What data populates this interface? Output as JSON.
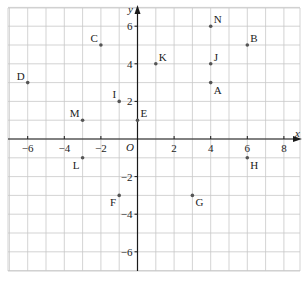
{
  "chart_data": {
    "type": "scatter",
    "title": "",
    "xlabel": "x",
    "ylabel": "y",
    "origin_label": "O",
    "xlim": [
      -7,
      8.9
    ],
    "ylim": [
      -7,
      7
    ],
    "grid": true,
    "x_ticks": [
      {
        "value": -6,
        "label": "−6"
      },
      {
        "value": -4,
        "label": "−4"
      },
      {
        "value": -2,
        "label": "−2"
      },
      {
        "value": 2,
        "label": "2"
      },
      {
        "value": 4,
        "label": "4"
      },
      {
        "value": 6,
        "label": "6"
      },
      {
        "value": 8,
        "label": "8"
      }
    ],
    "y_ticks": [
      {
        "value": 6,
        "label": "6"
      },
      {
        "value": 4,
        "label": "4"
      },
      {
        "value": 2,
        "label": "2"
      },
      {
        "value": -2,
        "label": "−2"
      },
      {
        "value": -4,
        "label": "−4"
      },
      {
        "value": -6,
        "label": "−6"
      }
    ],
    "points": [
      {
        "label": "A",
        "x": 4,
        "y": 3,
        "label_pos": "below-right"
      },
      {
        "label": "B",
        "x": 6,
        "y": 5,
        "label_pos": "above-right"
      },
      {
        "label": "C",
        "x": -2,
        "y": 5,
        "label_pos": "above-left"
      },
      {
        "label": "D",
        "x": -6,
        "y": 3,
        "label_pos": "above-left"
      },
      {
        "label": "E",
        "x": 0,
        "y": 1,
        "label_pos": "above-right"
      },
      {
        "label": "F",
        "x": -1,
        "y": -3,
        "label_pos": "below-left"
      },
      {
        "label": "G",
        "x": 3,
        "y": -3,
        "label_pos": "below-right"
      },
      {
        "label": "H",
        "x": 6,
        "y": -1,
        "label_pos": "below-right"
      },
      {
        "label": "I",
        "x": -1,
        "y": 2,
        "label_pos": "above-left"
      },
      {
        "label": "J",
        "x": 4,
        "y": 4,
        "label_pos": "above-right"
      },
      {
        "label": "K",
        "x": 1,
        "y": 4,
        "label_pos": "above-right"
      },
      {
        "label": "L",
        "x": -3,
        "y": -1,
        "label_pos": "below-left"
      },
      {
        "label": "M",
        "x": -3,
        "y": 1,
        "label_pos": "above-left"
      },
      {
        "label": "N",
        "x": 4,
        "y": 6,
        "label_pos": "above-right"
      }
    ],
    "colors": {
      "grid": "#c8c8c8",
      "axis": "#1a1a1a",
      "point": "#555555"
    }
  }
}
